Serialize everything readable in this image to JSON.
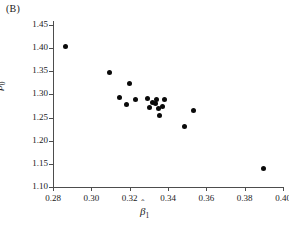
{
  "panel": {
    "label": "(B)"
  },
  "chart_data": {
    "type": "scatter",
    "title": "",
    "subtitle": "",
    "xlabel": "β̂1",
    "ylabel": "β̂0",
    "xlabel_base": "β",
    "xlabel_sub": "1",
    "ylabel_base": "β",
    "ylabel_sub": "0",
    "hat_glyph": "ˆ",
    "xlim": [
      0.28,
      0.4
    ],
    "ylim": [
      1.1,
      1.45
    ],
    "xticks": [
      0.28,
      0.3,
      0.32,
      0.34,
      0.36,
      0.38,
      0.4
    ],
    "yticks": [
      1.1,
      1.15,
      1.2,
      1.25,
      1.3,
      1.35,
      1.4,
      1.45
    ],
    "xticklabels": [
      "0.28",
      "0.30",
      "0.32",
      "0.34",
      "0.36",
      "0.38",
      "0.40"
    ],
    "yticklabels": [
      "1.10",
      "1.15",
      "1.20",
      "1.25",
      "1.30",
      "1.35",
      "1.40",
      "1.45"
    ],
    "grid": false,
    "legend": null,
    "marker": {
      "shape": "circle",
      "color": "#0a0a0a",
      "size": 5
    },
    "n_points": 18,
    "x": [
      0.2865,
      0.3093,
      0.32,
      0.3148,
      0.3185,
      0.3232,
      0.3292,
      0.3302,
      0.3318,
      0.3333,
      0.3338,
      0.3352,
      0.3358,
      0.3372,
      0.338,
      0.3488,
      0.3533,
      0.39
    ],
    "y": [
      1.4045,
      1.3475,
      1.323,
      1.2928,
      1.2778,
      1.2885,
      1.2905,
      1.2718,
      1.2815,
      1.2795,
      1.288,
      1.2698,
      1.254,
      1.2742,
      1.2885,
      1.2305,
      1.265,
      1.14
    ],
    "points": [
      {
        "x": 0.2865,
        "y": 1.4045
      },
      {
        "x": 0.3093,
        "y": 1.3475
      },
      {
        "x": 0.32,
        "y": 1.323
      },
      {
        "x": 0.3148,
        "y": 1.2928
      },
      {
        "x": 0.3185,
        "y": 1.2778
      },
      {
        "x": 0.3232,
        "y": 1.2885
      },
      {
        "x": 0.3292,
        "y": 1.2905
      },
      {
        "x": 0.3302,
        "y": 1.2718
      },
      {
        "x": 0.3318,
        "y": 1.2815
      },
      {
        "x": 0.3333,
        "y": 1.2795
      },
      {
        "x": 0.3338,
        "y": 1.288
      },
      {
        "x": 0.3352,
        "y": 1.2698
      },
      {
        "x": 0.3358,
        "y": 1.254
      },
      {
        "x": 0.3372,
        "y": 1.2742
      },
      {
        "x": 0.338,
        "y": 1.2885
      },
      {
        "x": 0.3488,
        "y": 1.2305
      },
      {
        "x": 0.3533,
        "y": 1.265
      },
      {
        "x": 0.39,
        "y": 1.14
      }
    ]
  }
}
